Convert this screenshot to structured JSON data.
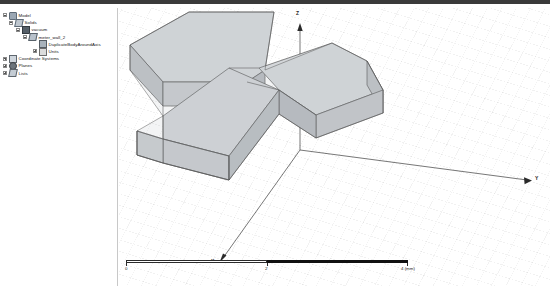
{
  "window": {
    "title": "3D Modeler"
  },
  "tree": {
    "name": "project-tree",
    "items": [
      {
        "label": "Model",
        "icon": "model-icon",
        "depth": 0,
        "expander": "minus"
      },
      {
        "label": "Solids",
        "icon": "solids-folder-icon",
        "depth": 1,
        "expander": "minus"
      },
      {
        "label": "vacuum",
        "icon": "vacuum-material-icon",
        "depth": 2,
        "expander": "minus"
      },
      {
        "label": "meter_wall_2",
        "icon": "body-icon",
        "depth": 3,
        "expander": "minus"
      },
      {
        "label": "DuplicateBodyAroundAxis",
        "icon": "operation-icon",
        "depth": 4,
        "expander": "none"
      },
      {
        "label": "Units",
        "icon": "units-icon",
        "depth": 4,
        "expander": "plus"
      },
      {
        "label": "Coordinate Systems",
        "icon": "coordinate-system-icon",
        "depth": 0,
        "expander": "plus"
      },
      {
        "label": "Planes",
        "icon": "planes-icon",
        "depth": 0,
        "expander": "plus"
      },
      {
        "label": "Lists",
        "icon": "lists-icon",
        "depth": 0,
        "expander": "plus"
      }
    ]
  },
  "viewport": {
    "name": "3d-viewport",
    "axes": [
      {
        "label": "Z",
        "name": "z-axis-indicator"
      },
      {
        "label": "Y",
        "name": "y-axis-indicator"
      },
      {
        "label": "X",
        "name": "x-axis-indicator"
      }
    ],
    "model": {
      "name": "y-shaped-waveguide",
      "face_fill": "#c9cccf",
      "face_fill_light": "#d6d9dc",
      "face_fill_dark": "#b4b8bc",
      "edge_color": "#4a4a4a"
    }
  },
  "scalebar": {
    "name": "scale-bar",
    "ticks": [
      {
        "label": "0",
        "pos": 0
      },
      {
        "label": "2",
        "pos": 50
      },
      {
        "label": "4 (mm)",
        "pos": 100
      }
    ]
  }
}
